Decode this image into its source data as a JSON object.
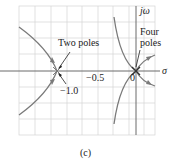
{
  "figure": {
    "caption": "(c)",
    "axes": {
      "x_label": "σ",
      "y_label": "jω",
      "origin_label": "0",
      "tick_labels": [
        "−0.5",
        "−1.0"
      ]
    },
    "annotations": [
      {
        "text": "Two poles",
        "target": "-1.0 double pole"
      },
      {
        "text": "Four poles",
        "target": "origin"
      }
    ],
    "colors": {
      "grid": "#d0d0d0",
      "locus": "#7a7a7a",
      "axis": "#6a6a6a",
      "text": "#222222"
    }
  }
}
